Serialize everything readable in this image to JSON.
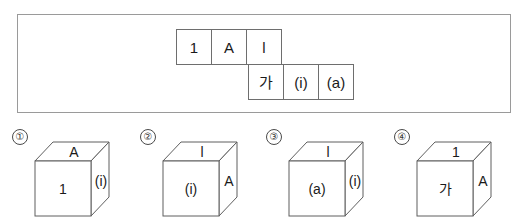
{
  "panel": {
    "net": {
      "description": "unfolded-cube-net",
      "rows": [
        {
          "offset_cells": 0,
          "cells": [
            {
              "id": "net-cell-1",
              "text": "1"
            },
            {
              "id": "net-cell-2",
              "text": "A"
            },
            {
              "id": "net-cell-3",
              "text": "l"
            }
          ]
        },
        {
          "offset_cells": 2,
          "cells": [
            {
              "id": "net-cell-4",
              "text": "가"
            },
            {
              "id": "net-cell-5",
              "text": "(i)"
            },
            {
              "id": "net-cell-6",
              "text": "(a)"
            }
          ]
        }
      ]
    }
  },
  "options": [
    {
      "number": "①",
      "faces": {
        "top": "A",
        "front": "1",
        "right": "(i)"
      }
    },
    {
      "number": "②",
      "faces": {
        "top": "l",
        "front": "(i)",
        "right": "A"
      }
    },
    {
      "number": "③",
      "faces": {
        "top": "l",
        "front": "(a)",
        "right": "(i)"
      }
    },
    {
      "number": "④",
      "faces": {
        "top": "1",
        "front": "가",
        "right": "A"
      }
    }
  ],
  "colors": {
    "panel_border": "#9a9a9a",
    "cell_border": "#6e6e6e",
    "cube_edge": "#5f5f5f",
    "text": "#1a1a1a",
    "background": "#ffffff"
  }
}
